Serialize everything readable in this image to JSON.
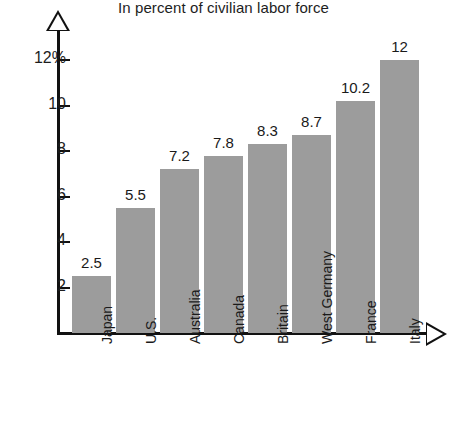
{
  "chart_data": {
    "type": "bar",
    "title": "In percent of civilian labor force",
    "xlabel": "",
    "ylabel": "",
    "categories": [
      "Japan",
      "U.S.",
      "Australia",
      "Canada",
      "Britain",
      "West Germany",
      "France",
      "Italy"
    ],
    "values": [
      2.5,
      5.5,
      7.2,
      7.8,
      8.3,
      8.7,
      10.2,
      12
    ],
    "value_labels": [
      "2.5",
      "5.5",
      "7.2",
      "7.8",
      "8.3",
      "8.7",
      "10.2",
      "12"
    ],
    "ylim": [
      0,
      12.8
    ],
    "yticks": [
      2,
      4,
      6,
      8,
      10,
      12
    ],
    "ytick_labels": [
      "2",
      "4",
      "6",
      "8",
      "10",
      "12%"
    ],
    "grid": false,
    "legend": null,
    "bar_color": "#9c9c9c",
    "axis_color": "#111111",
    "text_color": "#1a1a1a",
    "background": "#ffffff"
  }
}
